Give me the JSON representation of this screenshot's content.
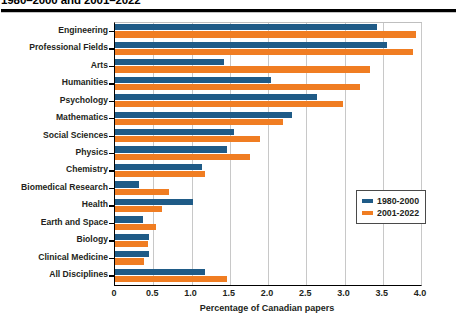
{
  "title": "1980–2000 and 2001–2022",
  "chart_data": {
    "type": "bar",
    "orientation": "horizontal",
    "title": "1980–2000 and 2001–2022",
    "xlabel": "Percentage of Canadian papers",
    "ylabel": "",
    "xlim": [
      0,
      4.0
    ],
    "xticks": [
      0,
      0.5,
      1.0,
      1.5,
      2.0,
      2.5,
      3.0,
      3.5,
      4.0
    ],
    "xtick_labels": [
      "0",
      "0.5",
      "1.0",
      "1.5",
      "2.0",
      "2.5",
      "3.0",
      "3.5",
      "4.0"
    ],
    "grid": true,
    "legend_position": "right-middle",
    "categories": [
      "Engineering",
      "Professional Fields",
      "Arts",
      "Humanities",
      "Psychology",
      "Mathematics",
      "Social Sciences",
      "Physics",
      "Chemistry",
      "Biomedical Research",
      "Health",
      "Earth and Space",
      "Biology",
      "Clinical Medicine",
      "All Disciplines"
    ],
    "series": [
      {
        "name": "1980-2000",
        "color": "#1f5b87",
        "values": [
          3.42,
          3.55,
          1.42,
          2.04,
          2.64,
          2.32,
          1.56,
          1.46,
          1.14,
          0.32,
          1.02,
          0.36,
          0.45,
          0.45,
          1.18
        ]
      },
      {
        "name": "2001-2022",
        "color": "#f07d22",
        "values": [
          3.94,
          3.9,
          3.33,
          3.2,
          2.98,
          2.2,
          1.9,
          1.76,
          1.18,
          0.7,
          0.62,
          0.54,
          0.43,
          0.38,
          1.46
        ]
      }
    ]
  },
  "axis": {
    "x_title": "Percentage of Canadian papers"
  },
  "legend": {
    "items": [
      {
        "label": "1980-2000",
        "color": "#1f5b87"
      },
      {
        "label": "2001-2022",
        "color": "#f07d22"
      }
    ]
  }
}
